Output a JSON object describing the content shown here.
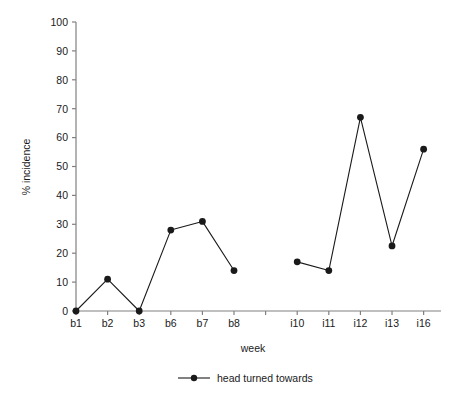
{
  "chart_data": {
    "type": "line",
    "title": "",
    "xlabel": "week",
    "ylabel": "% incidence",
    "categories": [
      "b1",
      "b2",
      "b3",
      "b6",
      "b7",
      "b8",
      "",
      "i10",
      "i11",
      "i12",
      "i13",
      "i16"
    ],
    "values": [
      0,
      11,
      0,
      28,
      31,
      14,
      null,
      17,
      14,
      67,
      22.5,
      56
    ],
    "series": [
      {
        "name": "head turned towards",
        "values": [
          0,
          11,
          0,
          28,
          31,
          14,
          null,
          17,
          14,
          67,
          22.5,
          56
        ]
      }
    ],
    "ylim": [
      0,
      100
    ],
    "ytick_labels": [
      "0",
      "10",
      "20",
      "30",
      "40",
      "50",
      "60",
      "70",
      "80",
      "90",
      "100"
    ],
    "ytick_values": [
      0,
      10,
      20,
      30,
      40,
      50,
      60,
      70,
      80,
      90,
      100
    ],
    "grid": false,
    "legend_position": "below-axis-center",
    "marker": "filled-circle",
    "line_color": "#1a1a1a",
    "marker_color": "#1a1a1a",
    "axis_color": "#808080",
    "background_color": "#ffffff",
    "note": "Line is broken between b8 and i10 at the unlabeled tick"
  },
  "legend": {
    "entries": [
      {
        "label": "head turned towards",
        "marker": "filled-circle",
        "color": "#1a1a1a"
      }
    ]
  },
  "axes": {
    "y_title": "% incidence",
    "x_title": "week"
  }
}
